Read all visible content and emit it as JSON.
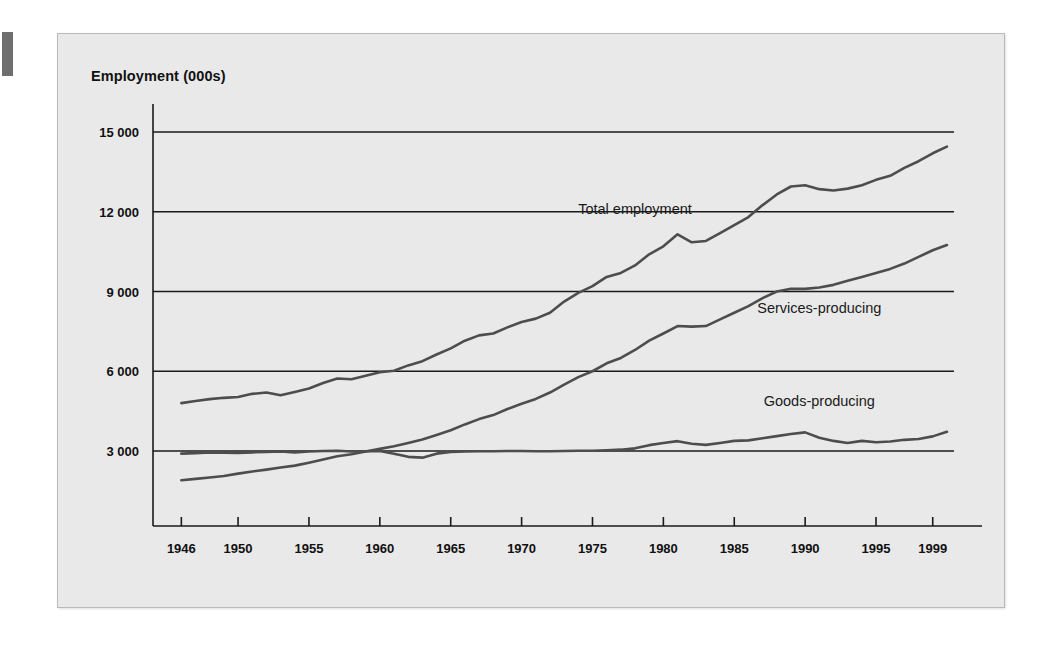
{
  "figure": {
    "title": "Employment (000s)",
    "panel_bg": "#e9e9e9",
    "line_color": "#4d4d4d",
    "axis_color": "#1a1a1a"
  },
  "chart_data": {
    "type": "line",
    "title": "Employment (000s)",
    "xlabel": "",
    "ylabel": "Employment (000s)",
    "xlim": [
      1944,
      2000.5
    ],
    "ylim": [
      0,
      16000
    ],
    "yticks": [
      3000,
      6000,
      9000,
      12000,
      15000
    ],
    "ytick_labels": [
      "3 000",
      "6 000",
      "9 000",
      "12 000",
      "15 000"
    ],
    "xticks": [
      1946,
      1950,
      1955,
      1960,
      1965,
      1970,
      1975,
      1980,
      1985,
      1990,
      1995,
      1999
    ],
    "xtick_labels": [
      "1946",
      "1950",
      "1955",
      "1960",
      "1965",
      "1970",
      "1975",
      "1980",
      "1985",
      "1990",
      "1995",
      "1999"
    ],
    "grid": "horizontal",
    "legend": "inline-annotations",
    "annotations": [
      {
        "text": "Total employment",
        "x": 1978,
        "y": 11900
      },
      {
        "text": "Services-producing",
        "x": 1991,
        "y": 8200
      },
      {
        "text": "Goods-producing",
        "x": 1991,
        "y": 4700
      }
    ],
    "x": [
      1946,
      1947,
      1948,
      1949,
      1950,
      1951,
      1952,
      1953,
      1954,
      1955,
      1956,
      1957,
      1958,
      1959,
      1960,
      1961,
      1962,
      1963,
      1964,
      1965,
      1966,
      1967,
      1968,
      1969,
      1970,
      1971,
      1972,
      1973,
      1974,
      1975,
      1976,
      1977,
      1978,
      1979,
      1980,
      1981,
      1982,
      1983,
      1984,
      1985,
      1986,
      1987,
      1988,
      1989,
      1990,
      1991,
      1992,
      1993,
      1994,
      1995,
      1996,
      1997,
      1998,
      1999,
      2000
    ],
    "series": [
      {
        "name": "Total employment",
        "values": [
          4800,
          4880,
          4950,
          5000,
          5030,
          5150,
          5200,
          5100,
          5220,
          5350,
          5560,
          5730,
          5700,
          5830,
          5960,
          6020,
          6220,
          6380,
          6630,
          6860,
          7150,
          7350,
          7420,
          7650,
          7850,
          7980,
          8200,
          8620,
          8950,
          9200,
          9550,
          9700,
          9980,
          10400,
          10700,
          11150,
          10850,
          10900,
          11200,
          11500,
          11800,
          12250,
          12650,
          12950,
          13000,
          12850,
          12800,
          12870,
          13000,
          13200,
          13350,
          13650,
          13900,
          14200,
          14450
        ]
      },
      {
        "name": "Services-producing",
        "values": [
          1900,
          1950,
          2000,
          2060,
          2150,
          2230,
          2300,
          2380,
          2450,
          2560,
          2680,
          2800,
          2880,
          2980,
          3080,
          3180,
          3300,
          3430,
          3600,
          3780,
          4000,
          4200,
          4350,
          4580,
          4780,
          4960,
          5200,
          5500,
          5780,
          6000,
          6300,
          6500,
          6800,
          7150,
          7420,
          7700,
          7680,
          7700,
          7950,
          8200,
          8450,
          8750,
          9000,
          9100,
          9100,
          9150,
          9250,
          9400,
          9550,
          9700,
          9850,
          10050,
          10300,
          10550,
          10750
        ]
      },
      {
        "name": "Goods-producing",
        "values": [
          2900,
          2920,
          2950,
          2940,
          2930,
          2950,
          2960,
          2980,
          2950,
          2980,
          3000,
          3010,
          2980,
          2990,
          3000,
          2900,
          2780,
          2750,
          2900,
          2960,
          2980,
          2990,
          2990,
          3000,
          3000,
          2990,
          2990,
          3000,
          3010,
          3010,
          3030,
          3050,
          3100,
          3220,
          3300,
          3370,
          3270,
          3230,
          3300,
          3380,
          3400,
          3480,
          3560,
          3640,
          3700,
          3500,
          3380,
          3300,
          3380,
          3330,
          3360,
          3420,
          3450,
          3550,
          3720
        ]
      }
    ]
  }
}
